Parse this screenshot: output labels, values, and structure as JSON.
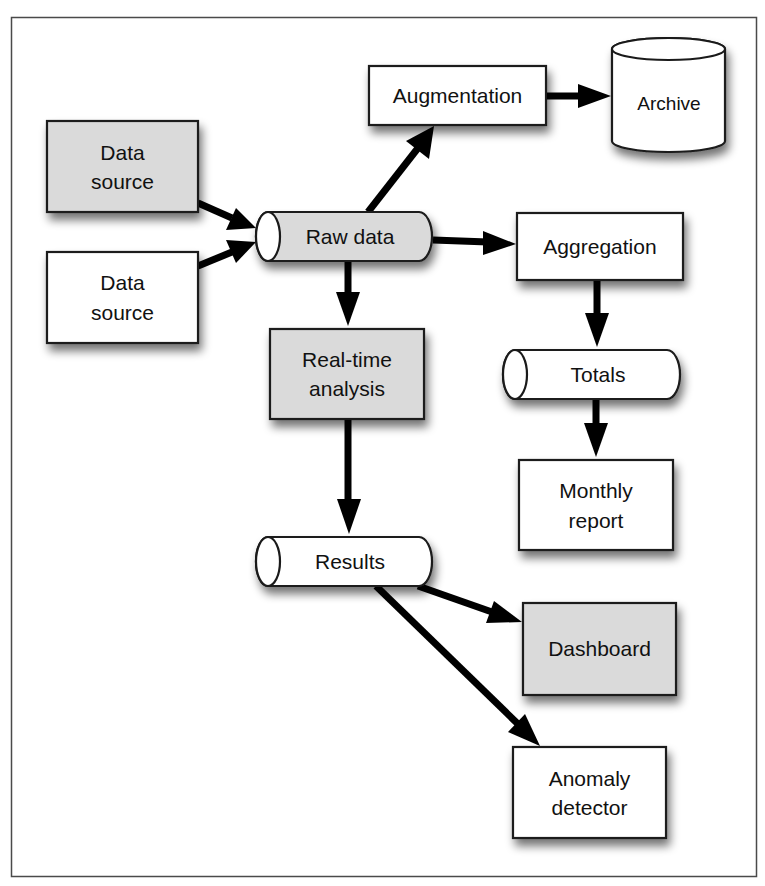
{
  "diagram": {
    "type": "data-flow",
    "colors": {
      "frame": "#4a4a4a",
      "background": "#ffffff",
      "shaded_fill": "#dadada",
      "plain_fill": "#ffffff",
      "stroke": "#1a1a1a",
      "arrow": "#000000"
    },
    "nodes": {
      "data_source_1": {
        "lines": [
          "Data",
          "source"
        ],
        "shape": "rectangle",
        "fill": "shaded"
      },
      "data_source_2": {
        "lines": [
          "Data",
          "source"
        ],
        "shape": "rectangle",
        "fill": "plain"
      },
      "raw_data": {
        "label": "Raw data",
        "shape": "horizontal-cylinder",
        "fill": "shaded"
      },
      "augmentation": {
        "label": "Augmentation",
        "shape": "rectangle",
        "fill": "plain"
      },
      "archive": {
        "label": "Archive",
        "shape": "vertical-cylinder",
        "fill": "plain"
      },
      "aggregation": {
        "label": "Aggregation",
        "shape": "rectangle",
        "fill": "plain"
      },
      "totals": {
        "label": "Totals",
        "shape": "horizontal-cylinder",
        "fill": "plain"
      },
      "monthly_report": {
        "lines": [
          "Monthly",
          "report"
        ],
        "shape": "rectangle",
        "fill": "plain"
      },
      "realtime_analysis": {
        "lines": [
          "Real-time",
          "analysis"
        ],
        "shape": "rectangle",
        "fill": "shaded"
      },
      "results": {
        "label": "Results",
        "shape": "horizontal-cylinder",
        "fill": "plain"
      },
      "dashboard": {
        "label": "Dashboard",
        "shape": "rectangle",
        "fill": "shaded"
      },
      "anomaly_detector": {
        "lines": [
          "Anomaly",
          "detector"
        ],
        "shape": "rectangle",
        "fill": "plain"
      }
    },
    "edges": [
      {
        "from": "data_source_1",
        "to": "raw_data"
      },
      {
        "from": "data_source_2",
        "to": "raw_data"
      },
      {
        "from": "raw_data",
        "to": "augmentation"
      },
      {
        "from": "augmentation",
        "to": "archive"
      },
      {
        "from": "raw_data",
        "to": "aggregation"
      },
      {
        "from": "aggregation",
        "to": "totals"
      },
      {
        "from": "totals",
        "to": "monthly_report"
      },
      {
        "from": "raw_data",
        "to": "realtime_analysis"
      },
      {
        "from": "realtime_analysis",
        "to": "results"
      },
      {
        "from": "results",
        "to": "dashboard"
      },
      {
        "from": "results",
        "to": "anomaly_detector"
      }
    ]
  }
}
